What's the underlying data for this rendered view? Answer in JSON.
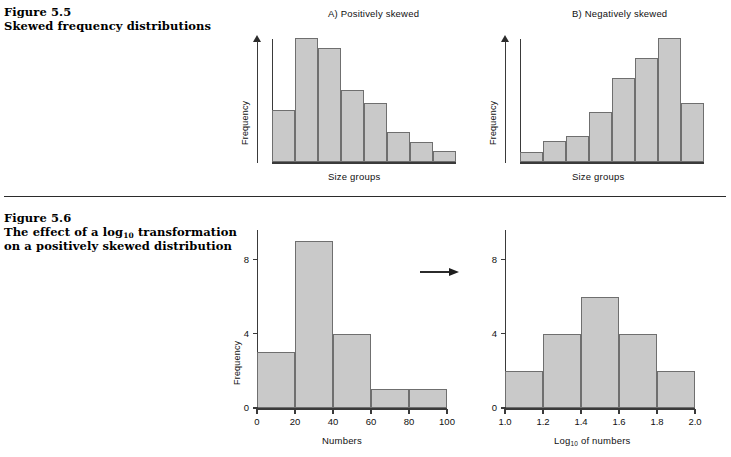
{
  "figure_55": {
    "number": "Figure 5.5",
    "title": "Skewed frequency distributions"
  },
  "figure_56": {
    "number": "Figure 5.6",
    "title_line1_pre": "The effect of a log",
    "title_line1_sub": "10",
    "title_line1_post": " transformation",
    "title_line2": "on a positively skewed distribution"
  },
  "transform_arrow": "right-arrow",
  "chart_data": [
    {
      "id": "positively-skewed",
      "type": "bar",
      "title": "A)  Positively skewed",
      "xlabel": "Size groups",
      "ylabel": "Frequency",
      "categories": [
        "1",
        "2",
        "3",
        "4",
        "5",
        "6",
        "7",
        "8"
      ],
      "values": [
        42,
        100,
        92,
        58,
        48,
        24,
        16,
        9
      ],
      "ylim": [
        0,
        105
      ],
      "axis_ticks": false,
      "grid": false,
      "bar_fill": "#c9c9c9",
      "bar_stroke": "#6f6f6f"
    },
    {
      "id": "negatively-skewed",
      "type": "bar",
      "title": "B)  Negatively skewed",
      "xlabel": "Size groups",
      "ylabel": "Frequency",
      "categories": [
        "1",
        "2",
        "3",
        "4",
        "5",
        "6",
        "7",
        "8"
      ],
      "values": [
        8,
        17,
        21,
        40,
        68,
        84,
        100,
        48
      ],
      "ylim": [
        0,
        105
      ],
      "axis_ticks": false,
      "grid": false,
      "bar_fill": "#c9c9c9",
      "bar_stroke": "#6f6f6f"
    },
    {
      "id": "numbers-histogram",
      "type": "bar",
      "title": "",
      "xlabel": "Numbers",
      "ylabel": "Frequency",
      "bin_edges": [
        0,
        20,
        40,
        60,
        80,
        100
      ],
      "values": [
        3,
        9,
        4,
        1,
        1
      ],
      "xticks": [
        "0",
        "20",
        "40",
        "60",
        "80",
        "100"
      ],
      "yticks": [
        "0",
        "4",
        "8"
      ],
      "xlim": [
        0,
        100
      ],
      "ylim": [
        0,
        9.6
      ],
      "grid": false,
      "bar_fill": "#c9c9c9",
      "bar_stroke": "#6f6f6f"
    },
    {
      "id": "log10-histogram",
      "type": "bar",
      "title": "",
      "xlabel_pre": "Log",
      "xlabel_sub": "10",
      "xlabel_post": " of numbers",
      "ylabel": "Frequency",
      "bin_edges": [
        1.0,
        1.2,
        1.4,
        1.6,
        1.8,
        2.0
      ],
      "values": [
        2,
        4,
        6,
        4,
        2
      ],
      "xticks": [
        "1.0",
        "1.2",
        "1.4",
        "1.6",
        "1.8",
        "2.0"
      ],
      "yticks": [
        "0",
        "4",
        "8"
      ],
      "xlim": [
        1.0,
        2.0
      ],
      "ylim": [
        0,
        9.6
      ],
      "grid": false,
      "bar_fill": "#c9c9c9",
      "bar_stroke": "#6f6f6f"
    }
  ]
}
